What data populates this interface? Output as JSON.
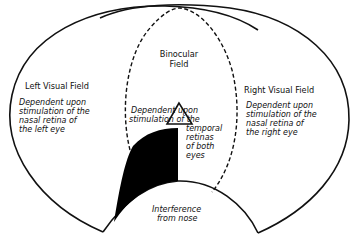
{
  "diagram": {
    "binocular_field": {
      "title_line1": "Binocular",
      "title_line2": "Field"
    },
    "left_field": {
      "title": "Left Visual Field",
      "desc": [
        "Dependent upon",
        "stimulation of the",
        "nasal retina of",
        "the left eye"
      ]
    },
    "right_field": {
      "title": "Right Visual Field",
      "desc": [
        "Dependent upon",
        "stimulation of the",
        "nasal retina of",
        "the right eye"
      ]
    },
    "center_desc": {
      "line1": "Dependent upon",
      "line2": "stimulation of the",
      "line3": "temporal",
      "line4": "retinas",
      "line5": "of both",
      "line6": "eyes"
    },
    "nose": {
      "line1": "Interference",
      "line2": "from nose"
    },
    "colors": {
      "line": "#111111",
      "fill_blind": "#000000",
      "background": "#ffffff"
    }
  }
}
